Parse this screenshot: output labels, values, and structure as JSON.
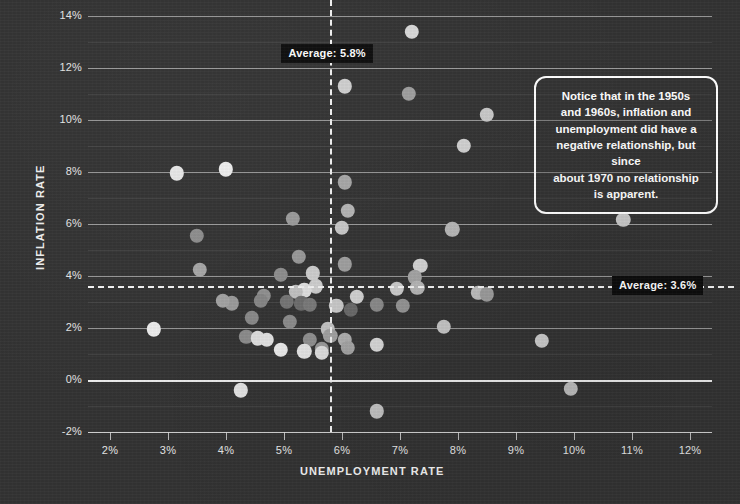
{
  "chart_data": {
    "type": "scatter",
    "title": "",
    "xlabel": "UNEMPLOYMENT RATE",
    "ylabel": "INFLATION RATE",
    "xlim": [
      1.65,
      12.4
    ],
    "ylim": [
      -2.6,
      14.6
    ],
    "grid": true,
    "legend": "none",
    "x_ticks": [
      "2%",
      "3%",
      "4%",
      "5%",
      "6%",
      "7%",
      "8%",
      "9%",
      "10%",
      "11%",
      "12%"
    ],
    "x_tick_values": [
      2,
      3,
      4,
      5,
      6,
      7,
      8,
      9,
      10,
      11,
      12
    ],
    "y_ticks": [
      "14%",
      "12%",
      "10%",
      "8%",
      "6%",
      "4%",
      "2%",
      "0%",
      "-2%"
    ],
    "y_tick_values": [
      14,
      12,
      10,
      8,
      6,
      4,
      2,
      0,
      -2
    ],
    "reference_lines": [
      {
        "name": "average-unemployment",
        "orientation": "vertical",
        "value": 5.8,
        "label": "Average: 5.8%",
        "style": "dashed"
      },
      {
        "name": "average-inflation",
        "orientation": "horizontal",
        "value": 3.6,
        "label": "Average: 3.6%",
        "style": "dashed"
      }
    ],
    "points": [
      {
        "x": 7.2,
        "y": 13.4,
        "shade": "#d9d9d9"
      },
      {
        "x": 6.05,
        "y": 11.3,
        "shade": "#cfcfcf"
      },
      {
        "x": 7.15,
        "y": 11.0,
        "shade": "#9e9e9e"
      },
      {
        "x": 8.5,
        "y": 10.2,
        "shade": "#c9c9c9"
      },
      {
        "x": 8.1,
        "y": 9.0,
        "shade": "#d2d2d2"
      },
      {
        "x": 4.0,
        "y": 8.1,
        "shade": "#efefef"
      },
      {
        "x": 3.15,
        "y": 7.95,
        "shade": "#e8e8e8"
      },
      {
        "x": 6.05,
        "y": 7.6,
        "shade": "#a8a8a8"
      },
      {
        "x": 6.1,
        "y": 6.5,
        "shade": "#b6b6b6"
      },
      {
        "x": 5.15,
        "y": 6.2,
        "shade": "#9c9c9c"
      },
      {
        "x": 10.85,
        "y": 6.15,
        "shade": "#c8c8c8"
      },
      {
        "x": 6.0,
        "y": 5.85,
        "shade": "#cacaca"
      },
      {
        "x": 7.9,
        "y": 5.8,
        "shade": "#b9b9b9"
      },
      {
        "x": 3.5,
        "y": 5.55,
        "shade": "#8e8e8e"
      },
      {
        "x": 5.25,
        "y": 4.75,
        "shade": "#9a9a9a"
      },
      {
        "x": 7.35,
        "y": 4.4,
        "shade": "#d6d6d6"
      },
      {
        "x": 6.05,
        "y": 4.45,
        "shade": "#a0a0a0"
      },
      {
        "x": 3.55,
        "y": 4.25,
        "shade": "#a7a7a7"
      },
      {
        "x": 5.5,
        "y": 4.1,
        "shade": "#cfcfcf"
      },
      {
        "x": 4.95,
        "y": 4.05,
        "shade": "#8f8f8f"
      },
      {
        "x": 7.25,
        "y": 3.95,
        "shade": "#a6a6a6"
      },
      {
        "x": 5.55,
        "y": 3.6,
        "shade": "#d0d0d0"
      },
      {
        "x": 7.3,
        "y": 3.55,
        "shade": "#b7b7b7"
      },
      {
        "x": 6.95,
        "y": 3.5,
        "shade": "#cdcdcd"
      },
      {
        "x": 5.35,
        "y": 3.45,
        "shade": "#e2e2e2"
      },
      {
        "x": 5.2,
        "y": 3.4,
        "shade": "#c4c4c4"
      },
      {
        "x": 8.35,
        "y": 3.35,
        "shade": "#c0c0c0"
      },
      {
        "x": 8.5,
        "y": 3.3,
        "shade": "#9d9d9d"
      },
      {
        "x": 6.25,
        "y": 3.2,
        "shade": "#d4d4d4"
      },
      {
        "x": 4.65,
        "y": 3.25,
        "shade": "#919191"
      },
      {
        "x": 4.6,
        "y": 3.05,
        "shade": "#878787"
      },
      {
        "x": 5.05,
        "y": 3.0,
        "shade": "#767676"
      },
      {
        "x": 5.3,
        "y": 2.95,
        "shade": "#6e6e6e"
      },
      {
        "x": 5.45,
        "y": 2.9,
        "shade": "#7a7a7a"
      },
      {
        "x": 4.1,
        "y": 2.95,
        "shade": "#9b9b9b"
      },
      {
        "x": 3.95,
        "y": 3.05,
        "shade": "#a4a4a4"
      },
      {
        "x": 5.9,
        "y": 2.85,
        "shade": "#cbcbcb"
      },
      {
        "x": 6.6,
        "y": 2.9,
        "shade": "#8b8b8b"
      },
      {
        "x": 7.05,
        "y": 2.85,
        "shade": "#959595"
      },
      {
        "x": 6.15,
        "y": 2.7,
        "shade": "#6a6a6a"
      },
      {
        "x": 4.45,
        "y": 2.4,
        "shade": "#8a8a8a"
      },
      {
        "x": 5.1,
        "y": 2.25,
        "shade": "#8d8d8d"
      },
      {
        "x": 2.75,
        "y": 1.95,
        "shade": "#ededed"
      },
      {
        "x": 7.75,
        "y": 2.05,
        "shade": "#c7c7c7"
      },
      {
        "x": 5.75,
        "y": 1.95,
        "shade": "#c6c6c6"
      },
      {
        "x": 5.8,
        "y": 1.7,
        "shade": "#a2a2a2"
      },
      {
        "x": 9.45,
        "y": 1.5,
        "shade": "#cccccc"
      },
      {
        "x": 4.35,
        "y": 1.65,
        "shade": "#8c8c8c"
      },
      {
        "x": 4.55,
        "y": 1.6,
        "shade": "#e0e0e0"
      },
      {
        "x": 4.7,
        "y": 1.55,
        "shade": "#e3e3e3"
      },
      {
        "x": 5.45,
        "y": 1.55,
        "shade": "#909090"
      },
      {
        "x": 6.05,
        "y": 1.55,
        "shade": "#b0b0b0"
      },
      {
        "x": 6.1,
        "y": 1.25,
        "shade": "#a5a5a5"
      },
      {
        "x": 5.65,
        "y": 1.2,
        "shade": "#999999"
      },
      {
        "x": 4.95,
        "y": 1.15,
        "shade": "#ececec"
      },
      {
        "x": 5.35,
        "y": 1.1,
        "shade": "#e6e6e6"
      },
      {
        "x": 5.65,
        "y": 1.05,
        "shade": "#dedede"
      },
      {
        "x": 6.6,
        "y": 1.35,
        "shade": "#d8d8d8"
      },
      {
        "x": 9.95,
        "y": -0.35,
        "shade": "#bdbdbd"
      },
      {
        "x": 4.25,
        "y": -0.4,
        "shade": "#e4e4e4"
      },
      {
        "x": 6.6,
        "y": -1.2,
        "shade": "#c2c2c2"
      }
    ],
    "annotations": [
      {
        "name": "insight-callout",
        "lines": [
          "Notice that in the 1950s",
          "and 1960s, inflation and",
          "unemployment did have a",
          "negative relationship, but since",
          "about 1970 no relationship",
          "is apparent."
        ]
      }
    ]
  },
  "colors": {
    "background": "#333333",
    "gridline": "#ebebeb",
    "zero_line": "#f8f8f8",
    "text": "#ededed",
    "label_badge_bg": "#0c0c0c"
  }
}
